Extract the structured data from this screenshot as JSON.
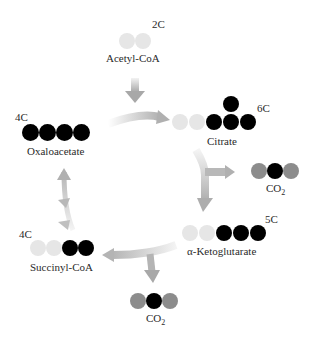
{
  "colors": {
    "carbon_new": "#e6e6e6",
    "carbon_old": "#000000",
    "oxygen": "#8c8c8c",
    "arrow": "#b4b4b4"
  },
  "molecules": {
    "acetyl_coa": {
      "name": "Acetyl-CoA",
      "carbons": "2C"
    },
    "citrate": {
      "name": "Citrate",
      "carbons": "6C"
    },
    "co2_first": {
      "name": "CO",
      "sub": "2"
    },
    "ketoglutarate": {
      "name": "α-Ketoglutarate",
      "carbons": "5C"
    },
    "co2_second": {
      "name": "CO",
      "sub": "2"
    },
    "succinyl_coa": {
      "name": "Succinyl-CoA",
      "carbons": "4C"
    },
    "oxaloacetate": {
      "name": "Oxaloacetate",
      "carbons": "4C"
    }
  }
}
